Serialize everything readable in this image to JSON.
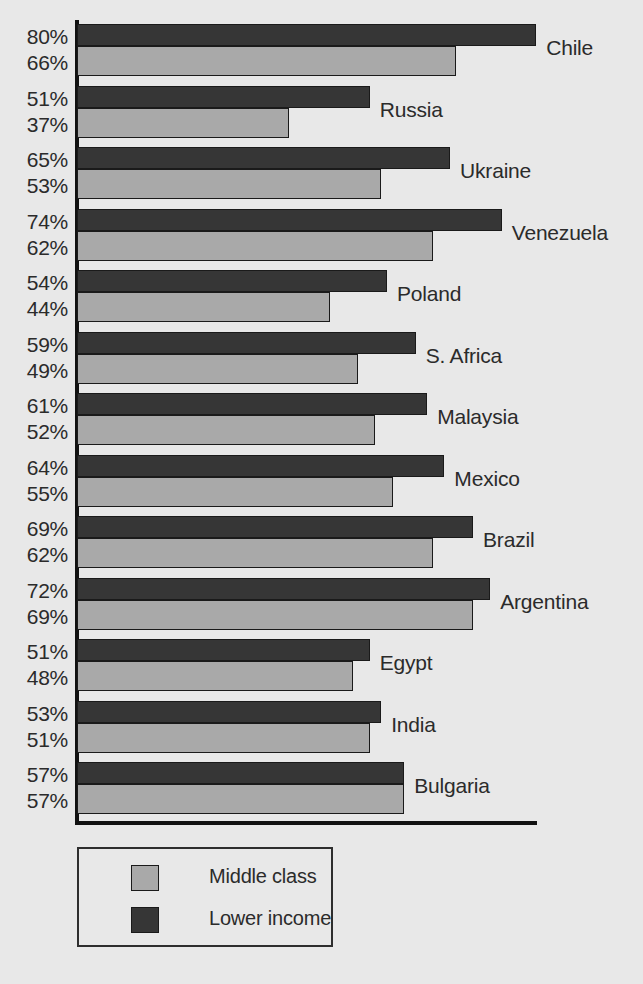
{
  "chart_data": {
    "type": "bar",
    "orientation": "horizontal",
    "title": "",
    "subtitle": "",
    "xlabel": "",
    "ylabel": "",
    "xlim": [
      0,
      80
    ],
    "grid": false,
    "legend_position": "bottom-left",
    "categories": [
      "Chile",
      "Russia",
      "Ukraine",
      "Venezuela",
      "Poland",
      "S. Africa",
      "Malaysia",
      "Mexico",
      "Brazil",
      "Argentina",
      "Egypt",
      "India",
      "Bulgaria"
    ],
    "series": [
      {
        "name": "Lower income",
        "color": "#363636",
        "values": [
          80,
          51,
          65,
          74,
          54,
          59,
          61,
          64,
          69,
          72,
          51,
          53,
          57
        ]
      },
      {
        "name": "Middle class",
        "color": "#a9a9a9",
        "values": [
          66,
          37,
          53,
          62,
          44,
          49,
          52,
          55,
          62,
          69,
          48,
          51,
          57
        ]
      }
    ],
    "value_labels": [
      {
        "lower": "80%",
        "middle": "66%"
      },
      {
        "lower": "51%",
        "middle": "37%"
      },
      {
        "lower": "65%",
        "middle": "53%"
      },
      {
        "lower": "74%",
        "middle": "62%"
      },
      {
        "lower": "54%",
        "middle": "44%"
      },
      {
        "lower": "59%",
        "middle": "49%"
      },
      {
        "lower": "61%",
        "middle": "52%"
      },
      {
        "lower": "64%",
        "middle": "55%"
      },
      {
        "lower": "69%",
        "middle": "62%"
      },
      {
        "lower": "72%",
        "middle": "69%"
      },
      {
        "lower": "51%",
        "middle": "48%"
      },
      {
        "lower": "53%",
        "middle": "51%"
      },
      {
        "lower": "57%",
        "middle": "57%"
      }
    ]
  },
  "legend": {
    "items": [
      {
        "label": "Middle class",
        "color": "#a9a9a9"
      },
      {
        "label": "Lower income",
        "color": "#363636"
      }
    ]
  },
  "colors": {
    "background": "#e8e8e8",
    "axis": "#111111",
    "text": "#2b2b2b",
    "lower_income": "#363636",
    "middle_class": "#a9a9a9"
  }
}
